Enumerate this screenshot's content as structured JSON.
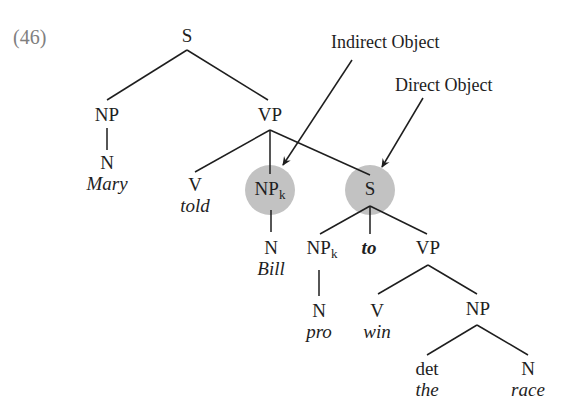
{
  "example_number": "(46)",
  "annotations": {
    "indirect_object": "Indirect Object",
    "direct_object": "Direct Object"
  },
  "highlight_color": "#c2c2c2",
  "tree": {
    "root": "S",
    "subject_np": {
      "label": "NP",
      "n": "N",
      "word": "Mary"
    },
    "vp": {
      "label": "VP",
      "verb": {
        "label": "V",
        "word": "told"
      },
      "indirect_np": {
        "label": "NP",
        "sub": "k",
        "n": "N",
        "word": "Bill"
      },
      "embedded_s": {
        "label": "S",
        "np": {
          "label": "NP",
          "sub": "k",
          "n": "N",
          "word": "pro"
        },
        "to": "to",
        "vp": {
          "label": "VP",
          "verb": {
            "label": "V",
            "word": "win"
          },
          "np": {
            "label": "NP",
            "det": {
              "label": "det",
              "word": "the"
            },
            "n": {
              "label": "N",
              "word": "race"
            }
          }
        }
      }
    }
  }
}
